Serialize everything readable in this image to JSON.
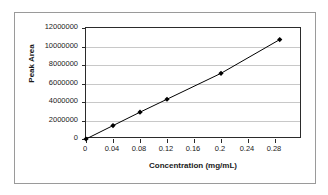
{
  "chart_data": {
    "type": "line",
    "title": "",
    "xlabel": "Concentration (mg/mL)",
    "ylabel": "Peak Area",
    "xlim": [
      0,
      0.32
    ],
    "ylim": [
      0,
      12000000
    ],
    "grid": true,
    "legend": "none",
    "marker": "diamond",
    "line_color": "#000000",
    "marker_color": "#000000",
    "grid_color": "#c8c8c8",
    "x": [
      0,
      0.04,
      0.08,
      0.12,
      0.2,
      0.287
    ],
    "y": [
      0,
      1450000,
      2900000,
      4300000,
      7100000,
      10750000
    ],
    "series": [
      {
        "name": "Peak Area",
        "points": [
          {
            "x": 0,
            "y": 0
          },
          {
            "x": 0.04,
            "y": 1450000
          },
          {
            "x": 0.08,
            "y": 2900000
          },
          {
            "x": 0.12,
            "y": 4300000
          },
          {
            "x": 0.2,
            "y": 7100000
          },
          {
            "x": 0.287,
            "y": 10750000
          }
        ]
      }
    ],
    "xticks": [
      0,
      0.04,
      0.08,
      0.12,
      0.16,
      0.2,
      0.24,
      0.28
    ],
    "xtick_labels": [
      "0",
      "0.04",
      "0.08",
      "0.12",
      "0.16",
      "0.2",
      "0.24",
      "0.28"
    ],
    "yticks": [
      0,
      2000000,
      4000000,
      6000000,
      8000000,
      10000000,
      12000000
    ],
    "ytick_labels": [
      "0",
      "2000000",
      "4000000",
      "6000000",
      "8000000",
      "10000000",
      "12000000"
    ]
  }
}
